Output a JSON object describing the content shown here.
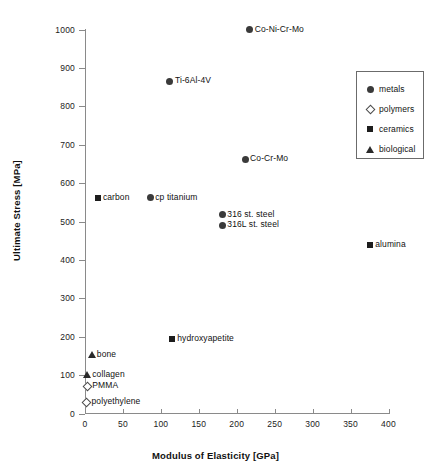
{
  "chart_data": {
    "type": "scatter",
    "title": "",
    "xlabel": "Modulus of Elasticity [GPa]",
    "ylabel": "Ultimate Stress [MPa]",
    "xlim": [
      0,
      400
    ],
    "ylim": [
      0,
      1000
    ],
    "xticks": [
      0,
      50,
      100,
      150,
      200,
      250,
      300,
      350,
      400
    ],
    "yticks": [
      0,
      100,
      200,
      300,
      400,
      500,
      600,
      700,
      800,
      900,
      1000
    ],
    "grid": false,
    "legend_position": "upper right",
    "legend": [
      {
        "label": "metals",
        "marker": "filled-circle"
      },
      {
        "label": "polymers",
        "marker": "open-diamond"
      },
      {
        "label": "ceramics",
        "marker": "filled-square"
      },
      {
        "label": "biological",
        "marker": "filled-triangle"
      }
    ],
    "series": [
      {
        "name": "metals",
        "marker": "filled-circle",
        "points": [
          {
            "label": "Co-Ni-Cr-Mo",
            "x": 217,
            "y": 1000,
            "label_side": "right"
          },
          {
            "label": "Ti-6Al-4V",
            "x": 112,
            "y": 865,
            "label_side": "right"
          },
          {
            "label": "Co-Cr-Mo",
            "x": 211,
            "y": 662,
            "label_side": "right"
          },
          {
            "label": "cp titanium",
            "x": 86,
            "y": 562,
            "label_side": "right"
          },
          {
            "label": "316 st. steel",
            "x": 181,
            "y": 518,
            "label_side": "right"
          },
          {
            "label": "316L st. steel",
            "x": 181,
            "y": 490,
            "label_side": "right"
          }
        ]
      },
      {
        "name": "ceramics",
        "marker": "filled-square",
        "points": [
          {
            "label": "carbon",
            "x": 17,
            "y": 562,
            "label_side": "right"
          },
          {
            "label": "alumina",
            "x": 376,
            "y": 440,
            "label_side": "right"
          },
          {
            "label": "hydroxyapetite",
            "x": 115,
            "y": 195,
            "label_side": "right"
          }
        ]
      },
      {
        "name": "biological",
        "marker": "filled-triangle",
        "points": [
          {
            "label": "bone",
            "x": 9,
            "y": 152,
            "label_side": "right"
          },
          {
            "label": "collagen",
            "x": 3,
            "y": 100,
            "label_side": "right"
          }
        ]
      },
      {
        "name": "polymers",
        "marker": "open-diamond",
        "points": [
          {
            "label": "PMMA",
            "x": 3,
            "y": 71,
            "label_side": "right"
          },
          {
            "label": "polyethylene",
            "x": 2,
            "y": 29,
            "label_side": "right"
          }
        ]
      }
    ]
  },
  "colors": {
    "axis": "#8a8a8a",
    "text": "#111111",
    "marker_dark": "#3a3a3a",
    "legend_border": "#6b6b6b",
    "background": "#ffffff"
  }
}
